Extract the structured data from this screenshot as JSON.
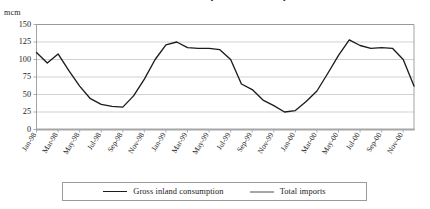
{
  "chart_data": {
    "type": "line",
    "title": "Gross inland consumption and total imports",
    "unit_label": "mcm",
    "xlabel": "",
    "ylabel": "",
    "ylim": [
      0,
      150
    ],
    "yticks": [
      0,
      25,
      50,
      75,
      100,
      125,
      150
    ],
    "grid": true,
    "legend_position": "bottom",
    "x": [
      "Jan-98",
      "Feb-98",
      "Mar-98",
      "Apr-98",
      "May-98",
      "Jun-98",
      "Jul-98",
      "Aug-98",
      "Sep-98",
      "Oct-98",
      "Nov-98",
      "Dec-98",
      "Jan-99",
      "Feb-99",
      "Mar-99",
      "Apr-99",
      "May-99",
      "Jun-99",
      "Jul-99",
      "Aug-99",
      "Sep-99",
      "Oct-99",
      "Nov-99",
      "Dec-99",
      "Jan-00",
      "Feb-00",
      "Mar-00",
      "Apr-00",
      "May-00",
      "Jun-00",
      "Jul-00",
      "Aug-00",
      "Sep-00",
      "Oct-00",
      "Nov-00",
      "Dec-00"
    ],
    "xtick_labels": [
      "Jan-98",
      "Mar-98",
      "May-98",
      "Jul-98",
      "Sep-98",
      "Nov-98",
      "Jan-99",
      "Mar-99",
      "May-99",
      "Jul-99",
      "Sep-99",
      "Nov-99",
      "Jan-00",
      "Mar-00",
      "May-00",
      "Jul-00",
      "Sep-00",
      "Nov-00"
    ],
    "series": [
      {
        "name": "Gross inland consumption",
        "color": "#1c1c1c",
        "values": [
          110,
          95,
          108,
          84,
          62,
          44,
          36,
          33,
          32,
          48,
          72,
          100,
          121,
          125,
          117,
          116,
          116,
          114,
          100,
          65,
          57,
          42,
          34,
          25,
          27,
          40,
          55,
          80,
          106,
          128,
          120,
          116,
          117,
          116,
          100,
          62
        ]
      },
      {
        "name": "Total imports",
        "color": "#a6a6a6",
        "values": [
          0,
          0,
          0,
          0,
          0,
          0,
          0,
          0,
          0,
          0,
          0,
          0,
          0,
          0,
          0,
          0,
          0,
          0,
          0,
          0,
          0,
          0,
          0,
          0,
          0,
          0,
          0,
          0,
          0,
          0,
          0,
          0,
          0,
          0,
          0,
          0
        ]
      }
    ]
  },
  "legend": {
    "items": [
      {
        "label": "Gross inland consumption"
      },
      {
        "label": "Total imports"
      }
    ]
  }
}
